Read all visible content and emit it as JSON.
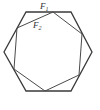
{
  "diagram": {
    "title": "",
    "shapes": [
      {
        "name": "F1",
        "label": "F",
        "subscript": "1",
        "type": "regular-hexagon",
        "points": [
          [
            26,
            12
          ],
          [
            71,
            12
          ],
          [
            92,
            52
          ],
          [
            71,
            91
          ],
          [
            26,
            91
          ],
          [
            4,
            52
          ]
        ]
      },
      {
        "name": "F2",
        "label": "F",
        "subscript": "2",
        "type": "hexagon",
        "points": [
          [
            53,
            12
          ],
          [
            82,
            34
          ],
          [
            79,
            75
          ],
          [
            45,
            91
          ],
          [
            14,
            69
          ],
          [
            17,
            28
          ]
        ]
      }
    ],
    "colors": {
      "stroke": "#3a3a3a",
      "background": "#ffffff"
    }
  }
}
